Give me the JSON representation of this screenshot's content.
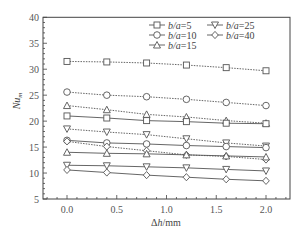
{
  "chart_data": {
    "type": "line",
    "title": "",
    "xlabel": "Δh/mm",
    "ylabel": "Nu_m",
    "xlim": [
      -0.3,
      2.25
    ],
    "ylim": [
      5,
      40
    ],
    "xticks": [
      0.0,
      0.5,
      1.0,
      1.5,
      2.0
    ],
    "xtick_labels": [
      "0.0",
      "0.5",
      "1.0",
      "1.5",
      "2.0"
    ],
    "yticks": [
      5,
      10,
      15,
      20,
      25,
      30,
      35,
      40
    ],
    "ytick_labels": [
      "5",
      "10",
      "15",
      "20",
      "25",
      "30",
      "35",
      "40"
    ],
    "grid": false,
    "legend_position": "upper right",
    "x": [
      0.0,
      0.4,
      0.8,
      1.2,
      1.6,
      2.0
    ],
    "legend": [
      {
        "label_italic": "b/a",
        "label_value": "=5",
        "marker": "square"
      },
      {
        "label_italic": "b/a",
        "label_value": "=25",
        "marker": "triangle-down"
      },
      {
        "label_italic": "b/a",
        "label_value": "=10",
        "marker": "circle"
      },
      {
        "label_italic": "b/a",
        "label_value": "=40",
        "marker": "diamond"
      },
      {
        "label_italic": "b/a",
        "label_value": "=15",
        "marker": "triangle-up"
      }
    ],
    "series": [
      {
        "name": "b/a=5 (dashed)",
        "marker": "square",
        "style": "dashed",
        "values": [
          31.5,
          31.4,
          31.2,
          30.8,
          30.3,
          29.7
        ]
      },
      {
        "name": "b/a=10 (dashed)",
        "marker": "circle",
        "style": "dashed",
        "values": [
          25.6,
          25.0,
          24.7,
          24.2,
          23.6,
          23.0
        ]
      },
      {
        "name": "b/a=15 (dashed)",
        "marker": "triangle-up",
        "style": "dashed",
        "values": [
          23.0,
          22.2,
          21.3,
          20.8,
          20.1,
          19.6
        ]
      },
      {
        "name": "b/a=5 (solid)",
        "marker": "square",
        "style": "solid",
        "values": [
          21.0,
          20.6,
          20.1,
          19.9,
          19.6,
          19.5
        ]
      },
      {
        "name": "b/a=25 (dashed)",
        "marker": "triangle-down",
        "style": "dashed",
        "values": [
          18.5,
          17.9,
          17.4,
          16.6,
          15.8,
          15.2
        ]
      },
      {
        "name": "b/a=10 (solid)",
        "marker": "circle",
        "style": "solid",
        "values": [
          16.3,
          15.8,
          15.6,
          15.3,
          15.1,
          14.9
        ]
      },
      {
        "name": "b/a=40 (dashed)",
        "marker": "diamond",
        "style": "dashed",
        "values": [
          16.1,
          15.1,
          14.3,
          13.5,
          13.2,
          12.6
        ]
      },
      {
        "name": "b/a=15 (solid)",
        "marker": "triangle-up",
        "style": "solid",
        "values": [
          14.0,
          13.8,
          13.7,
          13.5,
          13.3,
          13.1
        ]
      },
      {
        "name": "b/a=25 (solid)",
        "marker": "triangle-down",
        "style": "solid",
        "values": [
          11.5,
          11.4,
          11.2,
          11.0,
          10.7,
          10.4
        ]
      },
      {
        "name": "b/a=40 (solid)",
        "marker": "diamond",
        "style": "solid",
        "values": [
          10.6,
          10.1,
          9.6,
          9.2,
          8.8,
          8.5
        ]
      }
    ]
  },
  "colors": {
    "line": "#555555",
    "axis": "#444444",
    "background": "#ffffff"
  }
}
